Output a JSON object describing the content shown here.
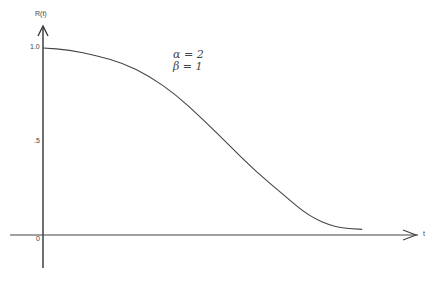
{
  "chart_data": {
    "type": "line",
    "title": "",
    "xlabel": "t",
    "ylabel": "R(t)",
    "ylim": [
      0,
      1.0
    ],
    "y_ticks": [
      "0",
      ".5",
      "1.0"
    ],
    "grid": false,
    "legend": null,
    "annotations": [
      "α = 2",
      "β = 1"
    ],
    "parameters": {
      "alpha": 2,
      "beta": 1
    },
    "series": [
      {
        "name": "R(t)",
        "x": [
          0,
          0.2,
          0.4,
          0.6,
          0.8,
          1.0,
          1.2,
          1.4,
          1.6,
          1.8,
          2.0,
          2.2,
          2.4
        ],
        "values": [
          1.0,
          0.99,
          0.96,
          0.92,
          0.85,
          0.75,
          0.62,
          0.48,
          0.34,
          0.22,
          0.1,
          0.04,
          0.03
        ]
      }
    ]
  },
  "labels": {
    "ylabel": "R(t)",
    "xlabel": "t",
    "y_top": "1.0",
    "y_mid": ".5",
    "origin": "0",
    "alpha_line": "α = 2",
    "beta_line": "β = 1"
  }
}
